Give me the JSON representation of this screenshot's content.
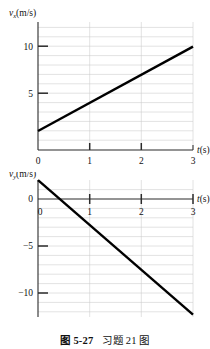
{
  "figure": {
    "caption_label": "图 5-27",
    "caption_text": "习题 21 图"
  },
  "chart_data": [
    {
      "type": "line",
      "title": "",
      "id": "upper",
      "xlabel": "t(s)",
      "ylabel": "v_x(m/s)",
      "ylabel_main": "v",
      "ylabel_sub": "x",
      "ylabel_unit": "(m/s)",
      "xlim": [
        0,
        3
      ],
      "ylim": [
        0,
        12
      ],
      "xticks": [
        0,
        1,
        2,
        3
      ],
      "xtick_labels": [
        "0",
        "1",
        "2",
        "3"
      ],
      "yticks": [
        5,
        10
      ],
      "ytick_labels": [
        "5",
        "10"
      ],
      "grid": true,
      "grid_y_step": 1,
      "grid_x_step": 1,
      "series": [
        {
          "name": "v_x vs t",
          "x": [
            0,
            3
          ],
          "y": [
            2,
            11
          ]
        }
      ],
      "slope": 3,
      "intercept": 2
    },
    {
      "type": "line",
      "title": "",
      "id": "lower",
      "xlabel": "t(s)",
      "ylabel": "v_y(m/s)",
      "ylabel_main": "v",
      "ylabel_sub": "y",
      "ylabel_unit": "(m/s)",
      "xlim": [
        0,
        3
      ],
      "ylim": [
        -13,
        3
      ],
      "xticks": [
        0,
        1,
        2,
        3
      ],
      "xtick_labels": [
        "0",
        "1",
        "2",
        "3"
      ],
      "yticks": [
        0,
        -5,
        -10
      ],
      "ytick_labels": [
        "0",
        "−5",
        "−10"
      ],
      "grid": true,
      "grid_y_step": 1,
      "grid_x_step": 1,
      "series": [
        {
          "name": "v_y vs t",
          "x": [
            0,
            3
          ],
          "y": [
            2,
            -12.3
          ]
        }
      ],
      "slope": -4.77,
      "intercept": 2
    }
  ],
  "colors": {
    "data_line": "#000000",
    "axis": "#2b2b2b",
    "grid": "#c9c9c9",
    "background": "#ffffff",
    "text": "#111111"
  }
}
